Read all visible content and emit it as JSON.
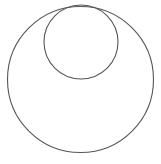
{
  "diagram": {
    "stroke_color": "#555555",
    "background": "#ffffff",
    "circles": [
      {
        "name": "outer-circle",
        "cx": 80.5,
        "cy": 79.5,
        "r": 73
      },
      {
        "name": "inner-circle",
        "cx": 81,
        "cy": 42,
        "r": 37
      }
    ]
  }
}
